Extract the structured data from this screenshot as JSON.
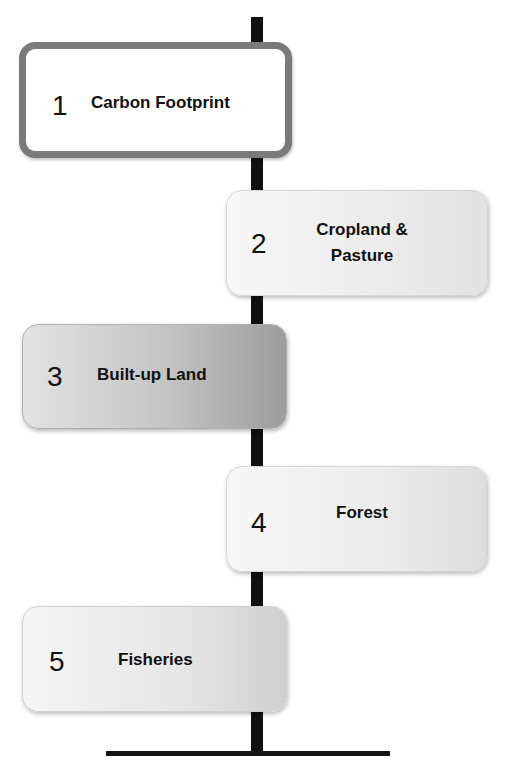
{
  "diagram": {
    "type": "vertical-timeline",
    "steps": [
      {
        "number": "1",
        "label": "Carbon Footprint",
        "highlighted": true
      },
      {
        "number": "2",
        "label": "Cropland & Pasture",
        "highlighted": false
      },
      {
        "number": "3",
        "label": "Built-up Land",
        "highlighted": false
      },
      {
        "number": "4",
        "label": "Forest",
        "highlighted": false
      },
      {
        "number": "5",
        "label": "Fisheries",
        "highlighted": false
      }
    ]
  },
  "colors": {
    "spine": "#111111",
    "highlight_border": "#7a7a7a",
    "box_light": "#f0f0f0",
    "box_dark": "#9d9d9d",
    "text": "#111111"
  }
}
